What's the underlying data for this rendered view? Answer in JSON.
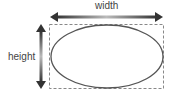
{
  "diagram": {
    "labels": {
      "width": "width",
      "height": "height"
    },
    "shapes": {
      "bounding_box": {
        "x": 49,
        "y": 24,
        "w": 115,
        "h": 65,
        "style": "dashed",
        "color": "#888888"
      },
      "ellipse": {
        "cx": 107,
        "cy": 56,
        "rx": 56,
        "ry": 31,
        "color": "#555555"
      },
      "width_arrow": {
        "x1": 50,
        "x2": 163,
        "y": 17,
        "color": "#333333"
      },
      "height_arrow": {
        "x": 41,
        "y1": 25,
        "y2": 88,
        "color": "#333333"
      }
    }
  }
}
